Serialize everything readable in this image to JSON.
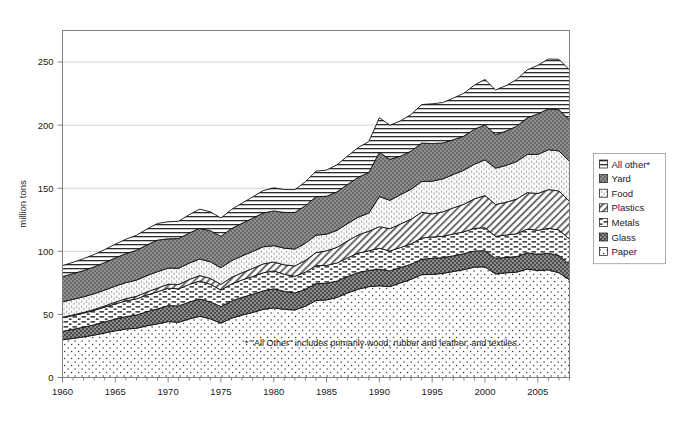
{
  "chart_data": {
    "type": "area",
    "title": "",
    "subtitle": "",
    "xlabel": "",
    "ylabel": "million tons",
    "stacked": true,
    "grid": true,
    "legend_position": "right",
    "xlim": [
      1960,
      2008
    ],
    "ylim": [
      0,
      275
    ],
    "yticks": [
      0,
      50,
      100,
      150,
      200,
      250
    ],
    "ytick_labels": [
      "0",
      "50",
      "100",
      "150",
      "200",
      "250"
    ],
    "xticks": [
      1960,
      1965,
      1970,
      1975,
      1980,
      1985,
      1990,
      1995,
      2000,
      2005
    ],
    "xtick_labels": [
      "1960",
      "1965",
      "1970",
      "1975",
      "1980",
      "1985",
      "1990",
      "1995",
      "2000",
      "2005"
    ],
    "x": [
      1960,
      1961,
      1962,
      1963,
      1964,
      1965,
      1966,
      1967,
      1968,
      1969,
      1970,
      1971,
      1972,
      1973,
      1974,
      1975,
      1976,
      1977,
      1978,
      1979,
      1980,
      1981,
      1982,
      1983,
      1984,
      1985,
      1986,
      1987,
      1988,
      1989,
      1990,
      1991,
      1992,
      1993,
      1994,
      1995,
      1996,
      1997,
      1998,
      1999,
      2000,
      2001,
      2002,
      2003,
      2004,
      2005,
      2006,
      2007,
      2008
    ],
    "stack_order_bottom_to_top": [
      "Paper",
      "Glass",
      "Metals",
      "Plastics",
      "Food",
      "Yard",
      "All other*"
    ],
    "series": [
      {
        "name": "Paper",
        "pattern": "sparse-dots",
        "values": [
          29.9,
          31.0,
          32.2,
          33.6,
          35.3,
          37.0,
          38.4,
          39.0,
          41.0,
          42.5,
          44.3,
          43.8,
          46.4,
          48.5,
          46.5,
          43.0,
          47.0,
          49.5,
          51.5,
          54.0,
          55.2,
          54.0,
          53.5,
          56.5,
          61.0,
          61.5,
          63.5,
          67.0,
          70.0,
          72.0,
          72.7,
          72.0,
          75.0,
          77.8,
          81.5,
          81.7,
          82.5,
          84.0,
          85.5,
          87.5,
          87.7,
          82.0,
          83.0,
          83.5,
          86.0,
          84.8,
          85.3,
          83.0,
          77.4
        ]
      },
      {
        "name": "Glass",
        "pattern": "dark-checker",
        "values": [
          6.7,
          7.2,
          7.7,
          8.2,
          8.8,
          9.3,
          9.9,
          10.5,
          11.2,
          11.9,
          12.7,
          12.9,
          13.4,
          13.7,
          13.4,
          13.2,
          13.6,
          14.0,
          14.4,
          14.7,
          15.1,
          14.3,
          13.5,
          13.4,
          13.4,
          13.2,
          12.9,
          13.1,
          13.2,
          12.9,
          13.1,
          12.5,
          12.1,
          12.0,
          12.2,
          12.8,
          12.5,
          12.4,
          12.6,
          12.8,
          12.8,
          12.4,
          12.2,
          12.3,
          12.8,
          12.8,
          13.2,
          13.6,
          12.2
        ]
      },
      {
        "name": "Metals",
        "pattern": "dashes",
        "values": [
          10.8,
          10.9,
          11.1,
          11.4,
          11.7,
          12.0,
          12.4,
          12.8,
          13.2,
          13.5,
          13.8,
          13.6,
          14.0,
          14.3,
          14.0,
          13.1,
          13.5,
          13.8,
          14.1,
          14.3,
          14.2,
          13.5,
          13.2,
          13.6,
          14.2,
          14.1,
          14.4,
          14.8,
          15.4,
          15.6,
          16.6,
          15.8,
          15.9,
          16.1,
          16.8,
          16.9,
          16.9,
          17.3,
          17.4,
          17.9,
          18.2,
          17.5,
          17.7,
          18.1,
          18.8,
          19.0,
          19.7,
          20.4,
          20.0
        ]
      },
      {
        "name": "Plastics",
        "pattern": "diagonal-hatch",
        "values": [
          0.4,
          0.5,
          0.6,
          0.7,
          0.9,
          1.4,
          1.7,
          2.0,
          2.4,
          2.9,
          3.1,
          3.4,
          3.9,
          4.3,
          4.6,
          4.5,
          5.2,
          5.7,
          6.4,
          7.0,
          7.0,
          7.5,
          8.2,
          9.3,
          10.4,
          11.6,
          12.4,
          13.4,
          14.4,
          15.4,
          17.1,
          17.6,
          18.7,
          19.5,
          20.4,
          18.3,
          19.3,
          20.7,
          21.8,
          23.4,
          25.5,
          25.2,
          26.0,
          27.5,
          28.9,
          29.2,
          30.7,
          30.8,
          30.0
        ]
      },
      {
        "name": "Food",
        "pattern": "light-dots",
        "values": [
          12.2,
          12.3,
          12.4,
          12.5,
          12.6,
          12.7,
          12.8,
          12.9,
          13.0,
          13.1,
          12.8,
          12.9,
          13.0,
          13.1,
          13.2,
          13.2,
          13.3,
          13.4,
          13.5,
          13.6,
          13.0,
          13.2,
          13.4,
          13.6,
          13.8,
          13.2,
          13.5,
          13.8,
          14.1,
          14.4,
          23.9,
          22.5,
          23.2,
          23.8,
          24.4,
          25.9,
          26.2,
          26.5,
          27.0,
          27.5,
          28.3,
          28.8,
          29.2,
          29.8,
          30.3,
          31.0,
          31.6,
          31.8,
          31.8
        ]
      },
      {
        "name": "Yard",
        "pattern": "dark-crosshatch",
        "values": [
          20.0,
          20.4,
          20.8,
          21.3,
          21.8,
          22.4,
          23.0,
          23.6,
          24.3,
          25.0,
          23.2,
          23.5,
          23.9,
          24.3,
          24.6,
          25.0,
          25.4,
          25.8,
          26.3,
          26.8,
          27.5,
          28.3,
          29.0,
          29.8,
          30.5,
          30.0,
          30.5,
          31.0,
          31.6,
          32.2,
          35.0,
          32.5,
          30.5,
          30.2,
          30.5,
          29.8,
          28.5,
          27.5,
          27.0,
          27.7,
          27.7,
          26.5,
          27.2,
          28.0,
          29.0,
          32.1,
          32.4,
          32.6,
          32.9
        ]
      },
      {
        "name": "All other*",
        "pattern": "horizontal-lines",
        "values": [
          8.7,
          9.0,
          9.4,
          9.8,
          10.3,
          10.9,
          11.4,
          11.9,
          12.6,
          13.2,
          13.5,
          13.8,
          14.5,
          15.2,
          15.0,
          14.4,
          15.2,
          16.0,
          16.9,
          17.7,
          18.3,
          18.2,
          18.1,
          19.0,
          20.2,
          20.8,
          21.5,
          22.5,
          23.6,
          24.5,
          27.5,
          27.0,
          28.0,
          29.0,
          30.5,
          31.5,
          32.0,
          33.0,
          34.0,
          35.0,
          36.0,
          35.5,
          36.0,
          37.0,
          38.0,
          38.5,
          39.5,
          40.0,
          39.5
        ]
      }
    ],
    "annotations": [
      {
        "name": "all-other-footnote",
        "text": "* \"All Other\" includes primarily wood, rubber and leather, and textiles.",
        "x": 1982,
        "y": 22
      }
    ],
    "legend_entries": [
      {
        "label": "All other*",
        "pattern": "horizontal-lines"
      },
      {
        "label": "Yard",
        "pattern": "dark-crosshatch"
      },
      {
        "label": "Food",
        "pattern": "light-dots"
      },
      {
        "label": "Plastics",
        "pattern": "diagonal-hatch"
      },
      {
        "label": "Metals",
        "pattern": "dashes"
      },
      {
        "label": "Glass",
        "pattern": "dark-checker"
      },
      {
        "label": "Paper",
        "pattern": "sparse-dots"
      }
    ],
    "colors": {
      "background": "#ffffff",
      "plot_border": "#808080",
      "gridline": "#c8c8c8",
      "series_outline": "#111111",
      "text": "#1a1a1a"
    }
  }
}
